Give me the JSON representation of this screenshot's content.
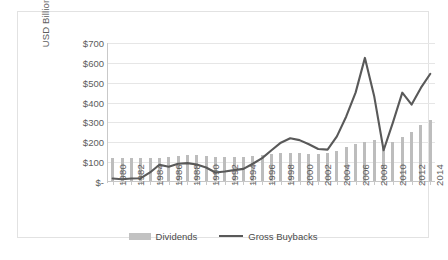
{
  "chart_data": {
    "type": "bar",
    "title": "",
    "xlabel": "",
    "ylabel": "USD Billions",
    "ylim": [
      0,
      700
    ],
    "ytick_values": [
      700,
      600,
      500,
      400,
      300,
      200,
      100,
      0
    ],
    "ytick_labels": [
      "$700",
      "$600",
      "$500",
      "$400",
      "$300",
      "$200",
      "$100",
      "$-"
    ],
    "grid": true,
    "legend_position": "bottom",
    "categories": [
      1980,
      1981,
      1982,
      1983,
      1984,
      1985,
      1986,
      1987,
      1988,
      1989,
      1990,
      1991,
      1992,
      1993,
      1994,
      1995,
      1996,
      1997,
      1998,
      1999,
      2000,
      2001,
      2002,
      2003,
      2004,
      2005,
      2006,
      2007,
      2008,
      2009,
      2010,
      2011,
      2012,
      2013,
      2014
    ],
    "xtick_labels": [
      "1980",
      "1982",
      "1984",
      "1986",
      "1988",
      "1990",
      "1992",
      "1994",
      "1996",
      "1998",
      "2000",
      "2002",
      "2004",
      "2006",
      "2008",
      "2010",
      "2012",
      "2014"
    ],
    "series": [
      {
        "name": "Dividends",
        "type": "bar",
        "color": "#bdbdbd",
        "values": [
          120,
          121,
          121,
          121,
          119,
          123,
          128,
          132,
          138,
          134,
          129,
          127,
          126,
          127,
          128,
          131,
          136,
          141,
          144,
          145,
          145,
          142,
          141,
          145,
          156,
          174,
          192,
          203,
          210,
          176,
          204,
          226,
          252,
          288,
          314
        ]
      },
      {
        "name": "Gross Buybacks",
        "type": "line",
        "color": "#595959",
        "values": [
          18,
          14,
          18,
          19,
          48,
          87,
          77,
          92,
          95,
          88,
          73,
          48,
          53,
          60,
          66,
          92,
          120,
          160,
          198,
          220,
          211,
          190,
          166,
          163,
          230,
          330,
          450,
          625,
          430,
          160,
          300,
          450,
          390,
          475,
          545
        ]
      }
    ]
  },
  "legend": {
    "items": [
      {
        "label": "Dividends"
      },
      {
        "label": "Gross Buybacks"
      }
    ]
  }
}
